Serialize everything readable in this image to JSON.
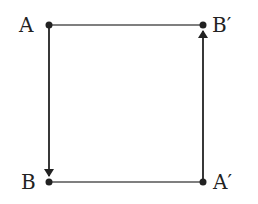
{
  "diagram": {
    "nodes": [
      {
        "id": "A",
        "label": "A",
        "x": 49,
        "y": 25
      },
      {
        "id": "Bp",
        "label": "B′",
        "x": 203,
        "y": 25
      },
      {
        "id": "B",
        "label": "B",
        "x": 49,
        "y": 182
      },
      {
        "id": "Ap",
        "label": "A′",
        "x": 203,
        "y": 182
      }
    ],
    "edges": [
      {
        "from": "A",
        "to": "Bp",
        "arrow": false
      },
      {
        "from": "A",
        "to": "B",
        "arrow": true
      },
      {
        "from": "B",
        "to": "Ap",
        "arrow": false
      },
      {
        "from": "Ap",
        "to": "Bp",
        "arrow": true
      }
    ],
    "colors": {
      "stroke": "#222222",
      "horizontal": "#555555"
    }
  }
}
